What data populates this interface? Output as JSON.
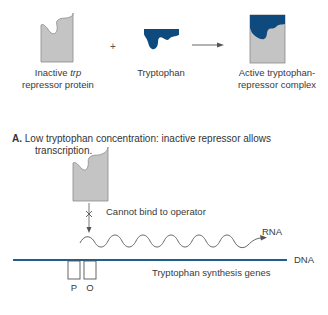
{
  "top_row": {
    "inactive_repressor": {
      "label_line1_prefix": "Inactive ",
      "label_line1_italic": "trp",
      "label_line2": "repressor protein"
    },
    "plus_sign": "+",
    "tryptophan": {
      "label": "Tryptophan"
    },
    "arrow": "→",
    "active_complex": {
      "label_line1": "Active tryptophan-",
      "label_line2": "repressor complex"
    }
  },
  "section_a": {
    "letter": "A.",
    "title_line1": "Low tryptophan concentration: inactive repressor allows",
    "title_line2": "transcription.",
    "annotation": "Cannot bind to operator",
    "rna_label": "RNA",
    "dna_label": "DNA",
    "genes_label": "Tryptophan synthesis genes",
    "promoter_label": "P",
    "operator_label": "O"
  },
  "colors": {
    "repressor_gray": "#c4c4c4",
    "repressor_outline": "#7a7a7a",
    "tryptophan_blue": "#0e4a7e",
    "dna_blue": "#1f5f8f",
    "text": "#3a3a3a"
  }
}
